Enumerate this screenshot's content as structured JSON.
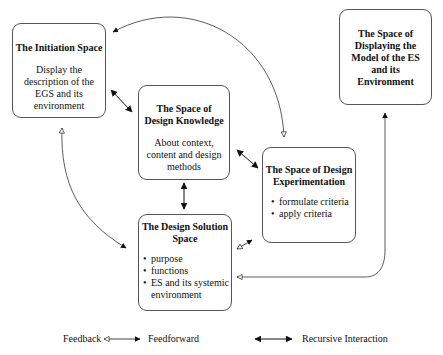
{
  "diagram": {
    "nodes": [
      {
        "id": "initiation",
        "title": "The Initiation Space",
        "description": "Display the description of the EGS and its environment"
      },
      {
        "id": "knowledge",
        "title": "The Space of Design Knowledge",
        "description": "About context, content and design methods"
      },
      {
        "id": "experimentation",
        "title": "The Space of Design Experimentation",
        "items": [
          "formulate criteria",
          "apply criteria"
        ]
      },
      {
        "id": "solution",
        "title": "The Design Solution Space",
        "items": [
          "purpose",
          "functions",
          "ES and its systemic environment"
        ]
      },
      {
        "id": "displaying",
        "title": "The Space of Displaying the Model of the ES and its Environment"
      }
    ],
    "edges": [
      {
        "from": "experimentation",
        "to": "initiation",
        "type": "feedback-feedforward",
        "note": "arc from top of experimentation box to initiation box"
      },
      {
        "from": "initiation",
        "to": "knowledge",
        "type": "recursive-interaction"
      },
      {
        "from": "knowledge",
        "to": "experimentation",
        "type": "recursive-interaction"
      },
      {
        "from": "knowledge",
        "to": "solution",
        "type": "recursive-interaction"
      },
      {
        "from": "initiation",
        "to": "solution",
        "type": "feedback-feedforward"
      },
      {
        "from": "solution",
        "to": "experimentation",
        "type": "feedback-feedforward"
      },
      {
        "from": "solution",
        "to": "displaying",
        "type": "feedback-feedforward"
      }
    ]
  },
  "legend": {
    "feedback_label": "Feedback",
    "feedforward_label": "Feedforward",
    "recursive_label": "Recursive Interaction"
  }
}
